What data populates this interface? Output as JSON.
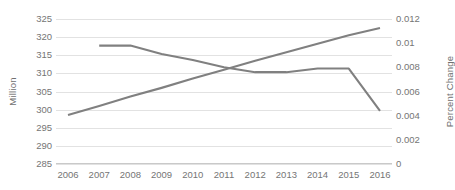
{
  "chart_data": {
    "type": "line",
    "title": "",
    "xlabel": "",
    "grid": true,
    "legend": "none",
    "categories": [
      "2006",
      "2007",
      "2008",
      "2009",
      "2010",
      "2011",
      "2012",
      "2013",
      "2014",
      "2015",
      "2016"
    ],
    "axes": {
      "left": {
        "label": "Million",
        "ticks": [
          "325",
          "320",
          "315",
          "310",
          "305",
          "300",
          "295",
          "290",
          "285"
        ],
        "tick_values": [
          325,
          320,
          315,
          310,
          305,
          300,
          295,
          290,
          285
        ],
        "min": 285,
        "max": 325,
        "step": 5
      },
      "right": {
        "label": "Percent Change",
        "ticks": [
          "0.012",
          "0.01",
          "0.008",
          "0.006",
          "0.004",
          "0.002",
          "0"
        ],
        "tick_values": [
          0.012,
          0.01,
          0.008,
          0.006,
          0.004,
          0.002,
          0
        ],
        "min": 0,
        "max": 0.012,
        "step": 0.002
      }
    },
    "series": [
      {
        "name": "Million",
        "axis": "left",
        "color": "#808080",
        "x": [
          "2006",
          "2007",
          "2008",
          "2009",
          "2010",
          "2011",
          "2012",
          "2013",
          "2014",
          "2015",
          "2016"
        ],
        "values": [
          298.5,
          301.0,
          303.6,
          306.0,
          308.6,
          311.0,
          313.5,
          315.8,
          318.2,
          320.5,
          322.5
        ]
      },
      {
        "name": "Percent Change",
        "axis": "right",
        "color": "#808080",
        "x": [
          "2006",
          "2007",
          "2008",
          "2009",
          "2010",
          "2011",
          "2012",
          "2013",
          "2014",
          "2015",
          "2016"
        ],
        "values": [
          null,
          0.0098,
          0.0098,
          0.0091,
          0.0086,
          0.008,
          0.0076,
          0.0076,
          0.0079,
          0.0079,
          0.0044
        ]
      }
    ]
  }
}
